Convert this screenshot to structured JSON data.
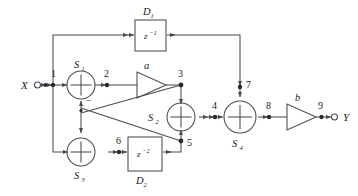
{
  "figure": {
    "type": "signal-flow-block-diagram",
    "background_color": "#ffffff",
    "line_color": "#4a4a52",
    "text_color": "#1a1a1a"
  },
  "io": {
    "input_label": "X",
    "output_label": "Y"
  },
  "nodes": [
    {
      "id": "1",
      "label": "1"
    },
    {
      "id": "2",
      "label": "2"
    },
    {
      "id": "3",
      "label": "3"
    },
    {
      "id": "4",
      "label": "4"
    },
    {
      "id": "5",
      "label": "5"
    },
    {
      "id": "6",
      "label": "6"
    },
    {
      "id": "7",
      "label": "7"
    },
    {
      "id": "8",
      "label": "8"
    },
    {
      "id": "9",
      "label": "9"
    }
  ],
  "summers": [
    {
      "id": "S1",
      "name": "S",
      "sub": "1",
      "symbol": "+",
      "sign_mark": "−"
    },
    {
      "id": "S2",
      "name": "S",
      "sub": "2",
      "symbol": "+"
    },
    {
      "id": "S3",
      "name": "S",
      "sub": "3",
      "symbol": "+"
    },
    {
      "id": "S4",
      "name": "S",
      "sub": "4",
      "symbol": "+"
    }
  ],
  "delay_blocks": [
    {
      "id": "D1",
      "name": "D",
      "sub": "1",
      "transfer": "z",
      "exponent": "−1"
    },
    {
      "id": "D2",
      "name": "D",
      "sub": "2",
      "transfer": "z",
      "exponent": "−2"
    }
  ],
  "gains": [
    {
      "id": "a",
      "label": "a"
    },
    {
      "id": "b",
      "label": "b"
    }
  ]
}
